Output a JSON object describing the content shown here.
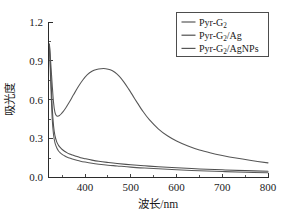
{
  "chart_data": {
    "type": "line",
    "title": "",
    "xlabel": "波长/nm",
    "ylabel": "吸光度",
    "xlim": [
      320,
      800
    ],
    "ylim": [
      0.0,
      1.2
    ],
    "grid": false,
    "legend_position": "top-right",
    "xticks": [
      400,
      500,
      600,
      700,
      800
    ],
    "xtick_labels": [
      "400",
      "500",
      "600",
      "700",
      "800"
    ],
    "yticks": [
      0.0,
      0.3,
      0.6,
      0.9,
      1.2
    ],
    "ytick_labels": [
      "0.0",
      "0.3",
      "0.6",
      "0.9",
      "1.2"
    ],
    "series": [
      {
        "name": "Pyr-G2",
        "legend_main": "Pyr-G",
        "legend_sub": "2",
        "legend_tail": "",
        "color": "#595959",
        "x": [
          322,
          325,
          328,
          331,
          334,
          338,
          342,
          346,
          350,
          355,
          360,
          366,
          372,
          380,
          390,
          400,
          415,
          430,
          450,
          470,
          500,
          530,
          560,
          600,
          650,
          700,
          750,
          800
        ],
        "y": [
          1.02,
          0.72,
          0.46,
          0.33,
          0.27,
          0.23,
          0.205,
          0.19,
          0.178,
          0.168,
          0.158,
          0.15,
          0.143,
          0.135,
          0.126,
          0.119,
          0.11,
          0.103,
          0.095,
          0.089,
          0.08,
          0.073,
          0.067,
          0.06,
          0.052,
          0.046,
          0.041,
          0.036
        ]
      },
      {
        "name": "Pyr-G2/Ag",
        "legend_main": "Pyr-G",
        "legend_sub": "2",
        "legend_tail": "/Ag",
        "color": "#4f4f4f",
        "x": [
          322,
          325,
          328,
          331,
          334,
          338,
          342,
          346,
          350,
          355,
          360,
          366,
          372,
          380,
          390,
          400,
          415,
          430,
          450,
          470,
          500,
          530,
          560,
          600,
          650,
          700,
          750,
          800
        ],
        "y": [
          1.03,
          0.8,
          0.55,
          0.4,
          0.325,
          0.275,
          0.248,
          0.23,
          0.216,
          0.203,
          0.192,
          0.182,
          0.174,
          0.164,
          0.153,
          0.145,
          0.134,
          0.125,
          0.116,
          0.108,
          0.098,
          0.09,
          0.083,
          0.075,
          0.066,
          0.059,
          0.053,
          0.048
        ]
      },
      {
        "name": "Pyr-G2/AgNPs",
        "legend_main": "Pyr-G",
        "legend_sub": "2",
        "legend_tail": "/AgNPs",
        "color": "#565656",
        "x": [
          322,
          325,
          328,
          331,
          334,
          337,
          340,
          344,
          348,
          352,
          358,
          365,
          375,
          385,
          395,
          405,
          415,
          425,
          435,
          445,
          455,
          465,
          475,
          485,
          495,
          505,
          515,
          525,
          540,
          560,
          580,
          600,
          625,
          650,
          675,
          700,
          730,
          760,
          800
        ],
        "y": [
          1.03,
          0.88,
          0.72,
          0.58,
          0.505,
          0.478,
          0.473,
          0.478,
          0.492,
          0.508,
          0.538,
          0.578,
          0.64,
          0.7,
          0.752,
          0.793,
          0.82,
          0.834,
          0.84,
          0.84,
          0.832,
          0.812,
          0.78,
          0.736,
          0.684,
          0.628,
          0.572,
          0.518,
          0.448,
          0.376,
          0.322,
          0.282,
          0.243,
          0.212,
          0.189,
          0.17,
          0.15,
          0.133,
          0.113
        ]
      }
    ],
    "peak_annotation": {
      "series": "Pyr-G2/AgNPs",
      "x": 445,
      "y": 0.84
    }
  },
  "legend": {
    "items": [
      {
        "label": "Pyr-G2",
        "main": "Pyr-G",
        "sub": "2",
        "tail": ""
      },
      {
        "label": "Pyr-G2/Ag",
        "main": "Pyr-G",
        "sub": "2",
        "tail": "/Ag"
      },
      {
        "label": "Pyr-G2/AgNPs",
        "main": "Pyr-G",
        "sub": "2",
        "tail": "/AgNPs"
      }
    ]
  },
  "colors": {
    "axis": "#2b2b2b",
    "text": "#1a1a1a",
    "background": "#ffffff"
  }
}
